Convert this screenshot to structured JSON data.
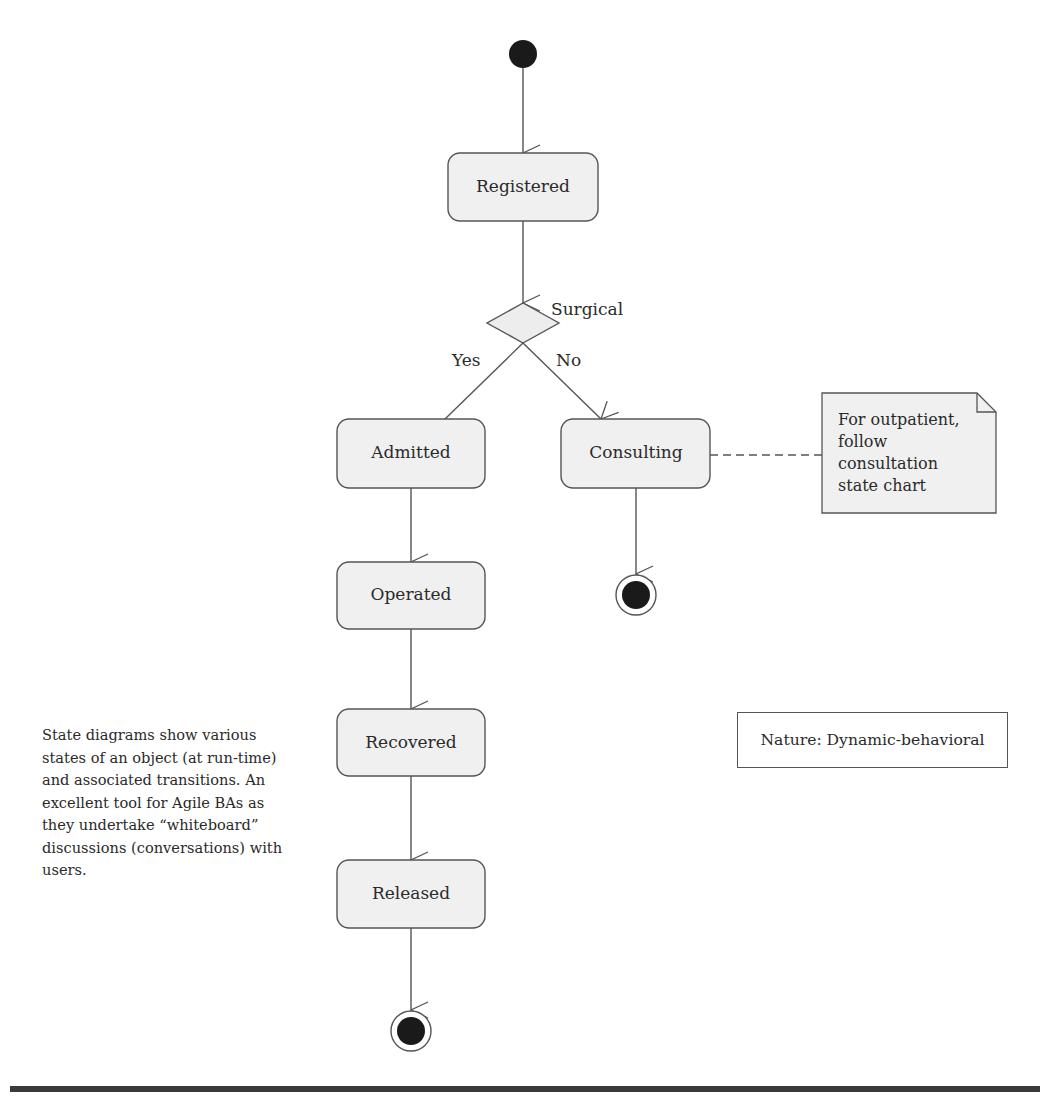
{
  "diagram": {
    "type": "UML state diagram",
    "states": [
      {
        "id": "registered",
        "label": "Registered"
      },
      {
        "id": "admitted",
        "label": "Admitted"
      },
      {
        "id": "consulting",
        "label": "Consulting"
      },
      {
        "id": "operated",
        "label": "Operated"
      },
      {
        "id": "recovered",
        "label": "Recovered"
      },
      {
        "id": "released",
        "label": "Released"
      }
    ],
    "decision": {
      "label": "Surgical",
      "yes_label": "Yes",
      "no_label": "No"
    },
    "transitions": [
      {
        "from": "initial",
        "to": "registered"
      },
      {
        "from": "registered",
        "to": "decision"
      },
      {
        "from": "decision",
        "to": "admitted",
        "label": "Yes"
      },
      {
        "from": "decision",
        "to": "consulting",
        "label": "No"
      },
      {
        "from": "admitted",
        "to": "operated"
      },
      {
        "from": "operated",
        "to": "recovered"
      },
      {
        "from": "recovered",
        "to": "released"
      },
      {
        "from": "released",
        "to": "final"
      },
      {
        "from": "consulting",
        "to": "final"
      }
    ],
    "note": {
      "lines": [
        "For outpatient,",
        "follow",
        "consultation",
        "state chart"
      ],
      "attached_to": "consulting"
    }
  },
  "side_text": "State diagrams show various states of an object (at run-time) and associated transitions. An excellent tool for Agile BAs as they undertake “whiteboard” discussions (conversations) with users.",
  "nature_box": "Nature: Dynamic-behavioral",
  "colors": {
    "state_fill": "#f0f0f0",
    "stroke": "#555555",
    "node_fill": "#1a1a1a",
    "rule": "#3a3a3a"
  }
}
